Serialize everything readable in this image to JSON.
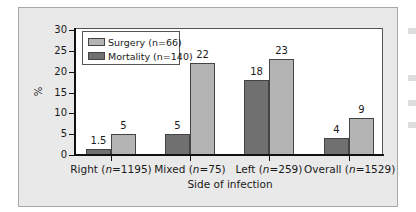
{
  "chart_data": {
    "type": "bar",
    "title": "",
    "xlabel": "Side of infection",
    "ylabel": "%",
    "ylim": [
      0,
      30
    ],
    "yticks": [
      0,
      5,
      10,
      15,
      20,
      25,
      30
    ],
    "grid": false,
    "legend_position": "top-left",
    "categories": [
      "Right (n=1195)",
      "Mixed (n=75)",
      "Left (n=259)",
      "Overall (n=1529)"
    ],
    "series": [
      {
        "name": "Mortality (n=140)",
        "color": "#707070",
        "values": [
          1.5,
          5,
          18,
          4
        ]
      },
      {
        "name": "Surgery (n=66)",
        "color": "#b4b4b4",
        "values": [
          5,
          22,
          23,
          9
        ]
      }
    ],
    "data_labels": {
      "mortality": [
        "1.5",
        "5",
        "18",
        "4"
      ],
      "surgery": [
        "5",
        "22",
        "23",
        "9"
      ]
    }
  },
  "axis": {
    "ylabel": "%",
    "xlabel": "Side of infection",
    "yticks": [
      "0",
      "5",
      "10",
      "15",
      "20",
      "25",
      "30"
    ]
  },
  "legend": {
    "surgery": "Surgery (n=66)",
    "mortality": "Mortality (n=140)"
  }
}
